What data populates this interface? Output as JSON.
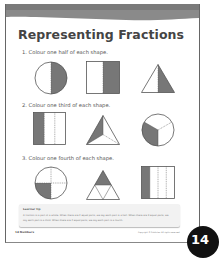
{
  "page": {
    "title": "Representing Fractions",
    "page_number": "14",
    "footer_left": "14   Numbers",
    "footer_right": "Copyright © Publisher. All rights reserved."
  },
  "questions": [
    {
      "number": "1.",
      "text": "1. Colour one half of each shape.",
      "shapes": [
        "circle-half",
        "rectangle-half",
        "triangle-half"
      ]
    },
    {
      "number": "2.",
      "text": "2. Colour one third of each shape.",
      "shapes": [
        "rectangle-thirds",
        "triangle-thirds",
        "circle-thirds"
      ]
    },
    {
      "number": "3.",
      "text": "3. Colour one fourth of each shape.",
      "shapes": [
        "circle-quarters",
        "triangle-quarters",
        "rectangle-quarters"
      ]
    }
  ],
  "tip": {
    "title": "Learner tip",
    "lines": [
      "A fraction is a part of a whole. When there are 2 equal parts, we say each part is a half. When there are 3 equal parts, we",
      "say each part is a third. When there are 4 equal parts, we say each part is a fourth."
    ]
  },
  "colors": {
    "shade": "#777777",
    "outline": "#555555",
    "band": "#8a8a8a",
    "badge": "#111111"
  }
}
